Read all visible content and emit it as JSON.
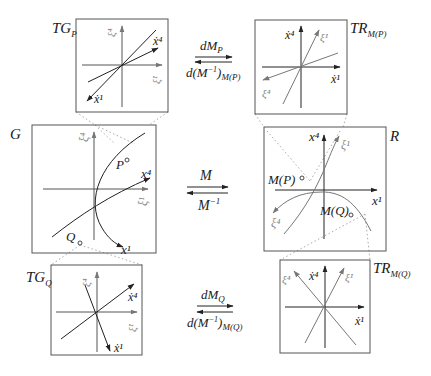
{
  "diagram": {
    "panels": {
      "TG_P": {
        "label": "TG",
        "label_sub": "P",
        "axes": {
          "vertical": "ξ̇⁴",
          "horizontal": "ξ̇¹"
        },
        "vectors": [
          {
            "label": "ẋ⁴"
          },
          {
            "label": "ẋ¹"
          }
        ]
      },
      "TR_MP": {
        "label": "TR",
        "label_sub": "M(P)",
        "axes": {
          "vertical": "ẋ⁴",
          "horizontal": "ẋ¹"
        },
        "vectors": [
          {
            "label": "ξ̇¹"
          },
          {
            "label": "ξ̇⁴"
          }
        ]
      },
      "G": {
        "label": "G",
        "axes": {
          "vertical": "ξ⁴",
          "horizontal": "ξ¹"
        },
        "curves": [
          {
            "label": "x⁴"
          },
          {
            "label": "x¹"
          }
        ],
        "points": [
          {
            "label": "P"
          },
          {
            "label": "Q"
          }
        ]
      },
      "R": {
        "label": "R",
        "axes": {
          "vertical": "x⁴",
          "horizontal": "x¹"
        },
        "curves": [
          {
            "label": "ξ¹"
          },
          {
            "label": "ξ⁴"
          }
        ],
        "points": [
          {
            "label": "M(P)"
          },
          {
            "label": "M(Q)"
          }
        ]
      },
      "TG_Q": {
        "label": "TG",
        "label_sub": "Q",
        "axes": {
          "vertical": "ξ̇⁴",
          "horizontal": "ξ̇¹"
        },
        "vectors": [
          {
            "label": "ẋ⁴"
          },
          {
            "label": "ẋ¹"
          }
        ]
      },
      "TR_MQ": {
        "label": "TR",
        "label_sub": "M(Q)",
        "axes": {
          "vertical": "ẋ⁴",
          "horizontal": "ẋ¹"
        },
        "vectors": [
          {
            "label": "ξ̇¹"
          },
          {
            "label": "ξ̇⁴"
          }
        ]
      }
    },
    "maps": {
      "top": {
        "forward": "dM",
        "forward_sub": "P",
        "backward": "d(M",
        "backward_sup": "−1",
        "backward_close": ")",
        "backward_sub": "M(P)"
      },
      "middle": {
        "forward": "M",
        "backward": "M",
        "backward_sup": "−1"
      },
      "bottom": {
        "forward": "dM",
        "forward_sub": "Q",
        "backward": "d(M",
        "backward_sup": "−1",
        "backward_close": ")",
        "backward_sub": "M(Q)"
      }
    }
  }
}
